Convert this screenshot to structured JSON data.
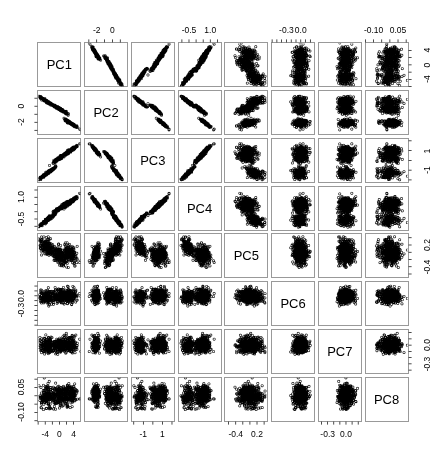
{
  "figure": {
    "type": "scatterplot-matrix",
    "title": "",
    "n_variables": 8,
    "variables": [
      "PC1",
      "PC2",
      "PC3",
      "PC4",
      "PC5",
      "PC6",
      "PC7",
      "PC8"
    ],
    "point_style": "open-circle",
    "point_color": "#000000",
    "point_fill": "#ffffff",
    "panel_border_color": "#808080",
    "background_color": "#ffffff",
    "axis_tick_color": "#000000",
    "n_points": 560
  },
  "diagonal_labels": [
    {
      "label": "PC1"
    },
    {
      "label": "PC2"
    },
    {
      "label": "PC3"
    },
    {
      "label": "PC4"
    },
    {
      "label": "PC5"
    },
    {
      "label": "PC6"
    },
    {
      "label": "PC7"
    },
    {
      "label": "PC8"
    }
  ],
  "axes": [
    {
      "variable": "PC1",
      "index": 0,
      "range": [
        -6.2,
        6.2
      ],
      "ticks": [
        -6,
        -4,
        -2,
        0,
        2,
        4
      ],
      "tick_labels": [
        "",
        "-4",
        "",
        "0",
        "",
        "4"
      ],
      "side_bottom": [
        "-4",
        "0",
        "4"
      ],
      "side_right": [
        "-4",
        "0",
        "4"
      ],
      "labelled_side": "bottom-and-right"
    },
    {
      "variable": "PC2",
      "index": 1,
      "range": [
        -3.6,
        2.0
      ],
      "ticks": [
        -3,
        -2,
        -1,
        0,
        1
      ],
      "tick_labels": [
        "",
        "-2",
        "",
        "0",
        ""
      ],
      "side_top": [
        "-2",
        "0"
      ],
      "side_left": [
        "-2",
        "0"
      ],
      "labelled_side": "top-and-left"
    },
    {
      "variable": "PC3",
      "index": 2,
      "range": [
        -2.3,
        2.3
      ],
      "ticks": [
        -2,
        -1,
        0,
        1,
        2
      ],
      "tick_labels": [
        "",
        "-1",
        "",
        "1",
        ""
      ],
      "side_bottom": [
        "-1",
        "1"
      ],
      "side_right": [
        "-1",
        "1"
      ],
      "labelled_side": "bottom-and-right"
    },
    {
      "variable": "PC4",
      "index": 3,
      "range": [
        -1.3,
        1.8
      ],
      "ticks": [
        -1.0,
        -0.5,
        0.0,
        0.5,
        1.0,
        1.5
      ],
      "tick_labels": [
        "",
        "-0.5",
        "",
        "",
        "1.0",
        ""
      ],
      "side_top": [
        "-0.5",
        "1.0"
      ],
      "side_left": [
        "-0.5",
        "1.0"
      ],
      "labelled_side": "top-and-left"
    },
    {
      "variable": "PC5",
      "index": 4,
      "range": [
        -0.72,
        0.52
      ],
      "ticks": [
        -0.6,
        -0.4,
        -0.2,
        0.0,
        0.2,
        0.4
      ],
      "tick_labels": [
        "",
        "-0.4",
        "",
        "",
        "0.2",
        ""
      ],
      "side_bottom": [
        "-0.4",
        "0.2"
      ],
      "side_right": [
        "-0.4",
        "0.2"
      ],
      "labelled_side": "bottom-and-right"
    },
    {
      "variable": "PC6",
      "index": 5,
      "range": [
        -0.62,
        0.3
      ],
      "ticks": [
        -0.6,
        -0.5,
        -0.4,
        -0.3,
        -0.2,
        -0.1,
        0.0,
        0.1,
        0.2
      ],
      "tick_labels": [
        "",
        "",
        "",
        "-0.3",
        "",
        "",
        "0.0",
        "",
        ""
      ],
      "side_top": [
        "-0.3",
        "0.0"
      ],
      "side_left": [
        "-0.3",
        "0.0"
      ],
      "labelled_side": "top-and-left"
    },
    {
      "variable": "PC7",
      "index": 6,
      "range": [
        -0.46,
        0.26
      ],
      "ticks": [
        -0.4,
        -0.3,
        -0.2,
        -0.1,
        0.0,
        0.1,
        0.2
      ],
      "tick_labels": [
        "",
        "-0.3",
        "",
        "",
        "0.0",
        "",
        ""
      ],
      "side_bottom": [
        "-0.3",
        "0.0"
      ],
      "side_right": [
        "-0.3",
        "0.0"
      ],
      "labelled_side": "bottom-and-right"
    },
    {
      "variable": "PC8",
      "index": 7,
      "range": [
        -0.155,
        0.115
      ],
      "ticks": [
        -0.15,
        -0.1,
        -0.05,
        0.0,
        0.05,
        0.1
      ],
      "tick_labels": [
        "",
        "-0.10",
        "",
        "",
        "0.05",
        ""
      ],
      "side_top": [
        "-0.10",
        "0.05"
      ],
      "side_left": [
        "-0.10",
        "0.05"
      ],
      "labelled_side": "top-and-left"
    }
  ],
  "top_axis_labels": [
    {
      "column": 2,
      "variable": "PC2",
      "labels": [
        "-2",
        "0"
      ]
    },
    {
      "column": 4,
      "variable": "PC4",
      "labels": [
        "-0.5",
        "1.0"
      ]
    },
    {
      "column": 6,
      "variable": "PC6",
      "labels": [
        "-0.3",
        "0.0"
      ]
    },
    {
      "column": 8,
      "variable": "PC8",
      "labels": [
        "-0.10",
        "0.05"
      ]
    }
  ],
  "bottom_axis_labels": [
    {
      "column": 1,
      "variable": "PC1",
      "labels": [
        "-4",
        "0",
        "4"
      ]
    },
    {
      "column": 3,
      "variable": "PC3",
      "labels": [
        "-1",
        "1"
      ]
    },
    {
      "column": 5,
      "variable": "PC5",
      "labels": [
        "-0.4",
        "0.2"
      ]
    },
    {
      "column": 7,
      "variable": "PC7",
      "labels": [
        "-0.3",
        "0.0"
      ]
    }
  ],
  "left_axis_labels": [
    {
      "row": 2,
      "variable": "PC2",
      "labels": [
        "0",
        "-2"
      ]
    },
    {
      "row": 4,
      "variable": "PC4",
      "labels": [
        "1.0",
        "-0.5"
      ]
    },
    {
      "row": 6,
      "variable": "PC6",
      "labels": [
        "0.0",
        "-0.3"
      ]
    },
    {
      "row": 8,
      "variable": "PC8",
      "labels": [
        "0.05",
        "-0.10"
      ]
    }
  ],
  "right_axis_labels": [
    {
      "row": 1,
      "variable": "PC1",
      "labels": [
        "4",
        "0",
        "-4"
      ]
    },
    {
      "row": 3,
      "variable": "PC3",
      "labels": [
        "1",
        "-1"
      ]
    },
    {
      "row": 5,
      "variable": "PC5",
      "labels": [
        "0.2",
        "-0.4"
      ]
    },
    {
      "row": 7,
      "variable": "PC7",
      "labels": [
        "0.0",
        "-0.3"
      ]
    }
  ],
  "chart_data": {
    "type": "scatter",
    "subtype": "scatterplot-matrix",
    "title": "",
    "xlabel": "",
    "ylabel": "",
    "grid": false,
    "legend": "none",
    "variables": [
      "PC1",
      "PC2",
      "PC3",
      "PC4",
      "PC5",
      "PC6",
      "PC7",
      "PC8"
    ],
    "axis_ranges": {
      "PC1": [
        -6.2,
        6.2
      ],
      "PC2": [
        -3.6,
        2.0
      ],
      "PC3": [
        -2.3,
        2.3
      ],
      "PC4": [
        -1.3,
        1.8
      ],
      "PC5": [
        -0.72,
        0.52
      ],
      "PC6": [
        -0.62,
        0.3
      ],
      "PC7": [
        -0.46,
        0.26
      ],
      "PC8": [
        -0.155,
        0.115
      ]
    },
    "clusters": [
      {
        "name": "cluster-A",
        "n": 190,
        "centers": {
          "PC1": -3.4,
          "PC2": 0.55,
          "PC3": -1.3,
          "PC4": -0.55,
          "PC5": 0.13,
          "PC6": -0.02,
          "PC7": -0.01,
          "PC8": -0.005
        },
        "spreads": {
          "PC1": 1.05,
          "PC2": 0.3,
          "PC3": 0.3,
          "PC4": 0.22,
          "PC5": 0.13,
          "PC6": 0.075,
          "PC7": 0.065,
          "PC8": 0.03
        }
      },
      {
        "name": "cluster-B",
        "n": 190,
        "centers": {
          "PC1": 0.1,
          "PC2": -0.35,
          "PC3": 0.25,
          "PC4": 0.25,
          "PC5": -0.1,
          "PC6": -0.01,
          "PC7": 0.0,
          "PC8": 0.0
        },
        "spreads": {
          "PC1": 1.05,
          "PC2": 0.3,
          "PC3": 0.3,
          "PC4": 0.22,
          "PC5": 0.13,
          "PC6": 0.075,
          "PC7": 0.065,
          "PC8": 0.03
        }
      },
      {
        "name": "cluster-C",
        "n": 180,
        "centers": {
          "PC1": 3.3,
          "PC2": -2.15,
          "PC3": 1.05,
          "PC4": 0.7,
          "PC5": -0.05,
          "PC6": 0.0,
          "PC7": 0.01,
          "PC8": 0.005
        },
        "spreads": {
          "PC1": 1.05,
          "PC2": 0.3,
          "PC3": 0.3,
          "PC4": 0.22,
          "PC5": 0.13,
          "PC6": 0.075,
          "PC7": 0.065,
          "PC8": 0.03
        }
      }
    ],
    "within_cluster_correlations": {
      "PC1_PC2": -0.95,
      "PC1_PC3": 0.93,
      "PC1_PC4": 0.9,
      "PC2_PC3": -0.9,
      "PC2_PC4": -0.88,
      "PC3_PC4": 0.9,
      "PC4_PC5": -0.55,
      "PC1_PC5": 0.05,
      "PC5_PC6": 0.02,
      "PC6_PC7": 0.01,
      "PC7_PC8": 0.01
    }
  },
  "geometry": {
    "grid_left": 36,
    "grid_top": 41,
    "cell_width": 46.75,
    "cell_height": 47.75,
    "gap": 2,
    "n": 8
  }
}
